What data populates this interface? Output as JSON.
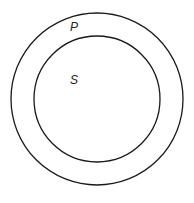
{
  "diagram": {
    "type": "venn-nested-circles",
    "outer_circle": {
      "label": "P",
      "cx": 97,
      "cy": 99,
      "r": 86
    },
    "inner_circle": {
      "label": "S",
      "cx": 97,
      "cy": 99,
      "r": 63
    },
    "stroke_color": "#1a1a1a"
  }
}
